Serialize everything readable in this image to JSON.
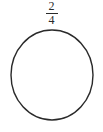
{
  "figure": {
    "background_color": "#ffffff",
    "stroke_color": "#2a2a2a",
    "text_color": "#2a2a2a"
  },
  "fraction": {
    "numerator": "2",
    "denominator": "4",
    "value_text": "2/4",
    "bar_label": "fraction-bar"
  },
  "circle": {
    "shape": "circle",
    "center_x": 52,
    "center_y": 75,
    "radius_x": 41,
    "radius_y": 45,
    "stroke_width": 1.4,
    "fill": "none",
    "shaded_parts": 0,
    "total_parts": 0,
    "divided": false
  }
}
